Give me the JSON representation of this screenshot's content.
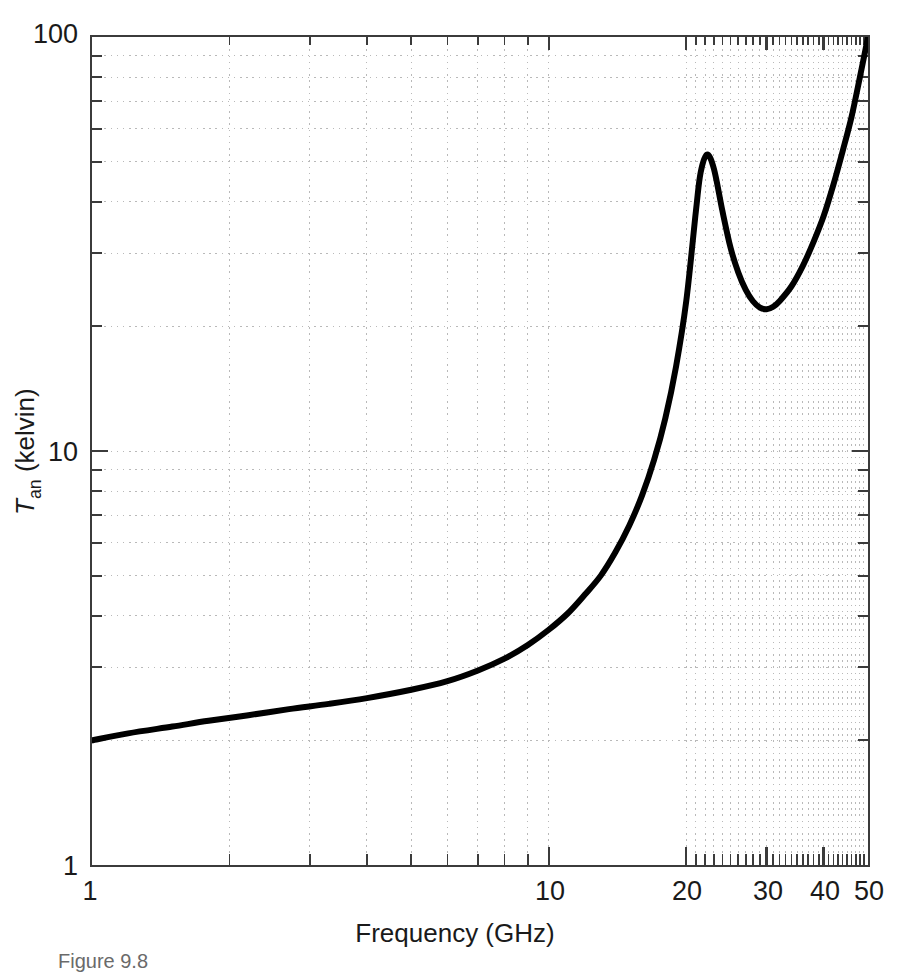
{
  "figure": {
    "caption": "Figure 9.8"
  },
  "axes": {
    "x_title": "Frequency (GHz)",
    "y_title_main": "T",
    "y_title_sub": "an",
    "y_title_unit": " (kelvin)",
    "x_tick_labels": [
      "1",
      "10",
      "20",
      "30",
      "40",
      "50"
    ],
    "y_tick_labels": [
      "1",
      "10",
      "100"
    ]
  },
  "colors": {
    "curve": "#000000",
    "axis": "#3b3b3b",
    "grid": "#b9b9b9",
    "text": "#1a1a1a"
  },
  "chart_data": {
    "type": "line",
    "title": "",
    "xlabel": "Frequency (GHz)",
    "ylabel": "T_an (kelvin)",
    "xscale": "log",
    "yscale": "log",
    "xlim": [
      1,
      50
    ],
    "ylim": [
      1,
      100
    ],
    "grid": true,
    "legend": "none",
    "xticks": [
      1,
      10,
      20,
      30,
      40,
      50
    ],
    "yticks": [
      1,
      10,
      100
    ],
    "series": [
      {
        "name": "Antenna noise temperature",
        "x": [
          1.0,
          1.2,
          1.5,
          1.8,
          2.2,
          2.7,
          3.3,
          4.0,
          5.0,
          6.0,
          7.0,
          8.0,
          9.0,
          10.0,
          11.0,
          12.0,
          13.0,
          14.0,
          15.0,
          16.0,
          17.0,
          18.0,
          19.0,
          20.0,
          21.0,
          21.5,
          22.2,
          23.0,
          24.0,
          25.0,
          26.0,
          27.0,
          28.0,
          29.0,
          30.0,
          31.0,
          32.0,
          34.0,
          36.0,
          38.0,
          40.0,
          42.0,
          44.0,
          46.0,
          48.0,
          50.0
        ],
        "y": [
          2.0,
          2.08,
          2.16,
          2.23,
          2.3,
          2.38,
          2.45,
          2.53,
          2.65,
          2.78,
          2.95,
          3.15,
          3.4,
          3.7,
          4.05,
          4.5,
          5.0,
          5.7,
          6.6,
          7.8,
          9.5,
          12.0,
          16.0,
          23.0,
          38.0,
          47.0,
          52.0,
          48.0,
          38.0,
          31.0,
          27.0,
          24.5,
          23.0,
          22.2,
          22.0,
          22.3,
          23.0,
          25.0,
          28.0,
          32.0,
          37.0,
          44.0,
          53.0,
          64.0,
          80.0,
          100.0
        ]
      }
    ],
    "annotations": [
      {
        "text": "water vapor absorption peak near 22 GHz",
        "x": 22.2,
        "y": 52
      },
      {
        "text": "window minimum near 30 GHz",
        "x": 30,
        "y": 22
      }
    ]
  }
}
